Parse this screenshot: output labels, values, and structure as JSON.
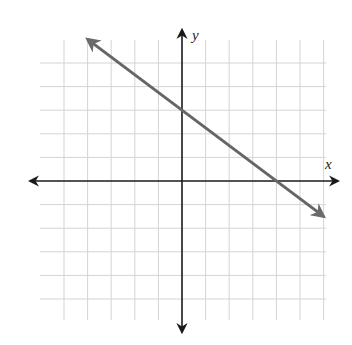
{
  "chart_data": {
    "type": "line",
    "title": "",
    "xlabel": "x",
    "ylabel": "y",
    "xlim": [
      -6,
      6
    ],
    "ylim": [
      -6,
      6
    ],
    "grid": true,
    "grid_step": 1,
    "series": [
      {
        "name": "line",
        "equation": "y = -3/4 x + 3",
        "slope": -0.75,
        "intercept": 3,
        "x": [
          -4,
          0,
          4,
          6
        ],
        "y": [
          6,
          3,
          0,
          -1.5
        ],
        "color": "#666666"
      }
    ],
    "annotations": {
      "y_intercept": [
        0,
        3
      ],
      "x_intercept": [
        4,
        0
      ]
    }
  },
  "axes": {
    "x_label": "x",
    "y_label": "y"
  },
  "colors": {
    "grid": "#d4d4d4",
    "axis": "#1a1a1a",
    "line": "#6a6a6a"
  }
}
